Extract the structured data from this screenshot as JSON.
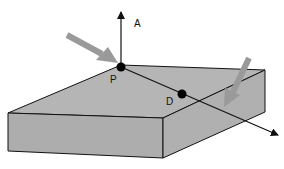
{
  "diagram": {
    "labels": {
      "a": "A",
      "p": "P",
      "d": "D"
    },
    "colors": {
      "block_fill": "#b3b3b3",
      "block_stroke": "#111111",
      "gray_arrow": "#9a9a9a",
      "point": "#000000"
    }
  }
}
